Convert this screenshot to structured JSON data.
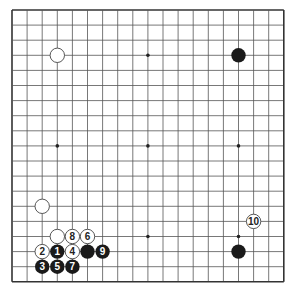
{
  "board": {
    "size": 19,
    "origin_x": 12,
    "origin_y": 10,
    "spacing": 15.1,
    "line_color": "#555555",
    "edge_color": "#333333",
    "background": "#ffffff"
  },
  "star_points": [
    [
      3,
      3
    ],
    [
      9,
      3
    ],
    [
      15,
      3
    ],
    [
      3,
      9
    ],
    [
      9,
      9
    ],
    [
      15,
      9
    ],
    [
      3,
      15
    ],
    [
      9,
      15
    ],
    [
      15,
      15
    ]
  ],
  "stones": [
    {
      "color": "white",
      "col": 3,
      "row": 3,
      "label": ""
    },
    {
      "color": "black",
      "col": 15,
      "row": 3,
      "label": ""
    },
    {
      "color": "white",
      "col": 2,
      "row": 13,
      "label": ""
    },
    {
      "color": "black",
      "col": 15,
      "row": 16,
      "label": ""
    },
    {
      "color": "white",
      "col": 3,
      "row": 15,
      "label": ""
    },
    {
      "color": "black",
      "col": 5,
      "row": 16,
      "label": ""
    },
    {
      "color": "black",
      "col": 3,
      "row": 16,
      "label": "1"
    },
    {
      "color": "white",
      "col": 2,
      "row": 16,
      "label": "2"
    },
    {
      "color": "black",
      "col": 2,
      "row": 17,
      "label": "3"
    },
    {
      "color": "white",
      "col": 4,
      "row": 16,
      "label": "4"
    },
    {
      "color": "black",
      "col": 3,
      "row": 17,
      "label": "5"
    },
    {
      "color": "white",
      "col": 5,
      "row": 15,
      "label": "6"
    },
    {
      "color": "black",
      "col": 4,
      "row": 17,
      "label": "7"
    },
    {
      "color": "white",
      "col": 4,
      "row": 15,
      "label": "8"
    },
    {
      "color": "black",
      "col": 6,
      "row": 16,
      "label": "9"
    },
    {
      "color": "white",
      "col": 16,
      "row": 14,
      "label": "10"
    }
  ],
  "colors": {
    "black_stone": "#1a1a1a",
    "white_stone": "#ffffff",
    "white_stroke": "#444444",
    "black_label": "#ffffff",
    "white_label": "#222222"
  }
}
